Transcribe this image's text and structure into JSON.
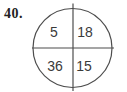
{
  "problem": {
    "number": "40."
  },
  "diagram": {
    "type": "circle-four-quadrants",
    "quadrants": {
      "top_left": "5",
      "top_right": "18",
      "bottom_left": "36",
      "bottom_right": "15"
    },
    "colors": {
      "stroke": "#4d4d4d",
      "text": "#3a3a3a",
      "problem_number": "#222222",
      "background": "#ffffff"
    }
  }
}
